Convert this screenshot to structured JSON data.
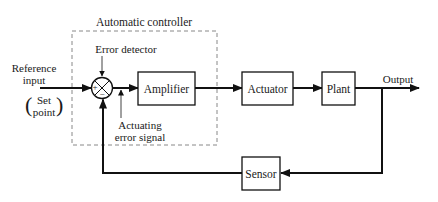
{
  "diagram": {
    "title": "Automatic controller",
    "type": "feedback control system block diagram",
    "blocks": [
      {
        "id": "amplifier",
        "label": "Amplifier"
      },
      {
        "id": "actuator",
        "label": "Actuator"
      },
      {
        "id": "plant",
        "label": "Plant"
      },
      {
        "id": "sensor",
        "label": "Sensor"
      }
    ],
    "summing_junction": {
      "label": "Error detector",
      "plus": "+",
      "minus": "−"
    },
    "labels": {
      "reference_line1": "Reference",
      "reference_line2": "input",
      "setpoint_line1": "Set",
      "setpoint_line2": "point",
      "actuating_line1": "Actuating",
      "actuating_line2": "error signal",
      "output": "Output"
    },
    "colors": {
      "line": "#111111",
      "dashed": "#888888",
      "background": "#ffffff"
    }
  }
}
